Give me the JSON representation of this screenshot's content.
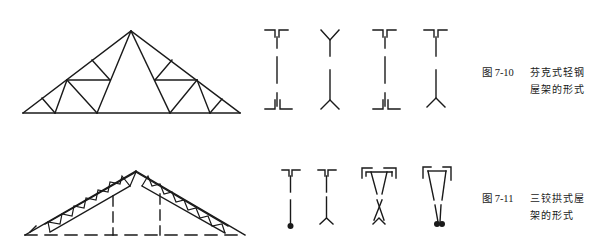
{
  "figures": [
    {
      "id": "7-10",
      "number": "图 7-10",
      "title_line1": "芬克式轻钢",
      "title_line2": "屋架的形式",
      "diagram": "fink-light-steel-roof-truss",
      "section_types": [
        "double-angle-tee",
        "y-shaped-tube-ends",
        "double-angle-tee",
        "double-angle-top-y-bottom"
      ]
    },
    {
      "id": "7-11",
      "number": "图 7-11",
      "title_line1": "三铰拱式屋",
      "title_line2": "架的形式",
      "diagram": "three-hinged-arch-roof-truss",
      "section_types": [
        "double-angle-top-round-bar",
        "double-angle-top-y-bottom",
        "triangular-double-angle",
        "trapezoid-double-bar"
      ]
    }
  ],
  "colors": {
    "ink": "#1a1a1a",
    "paper": "#ffffff"
  }
}
